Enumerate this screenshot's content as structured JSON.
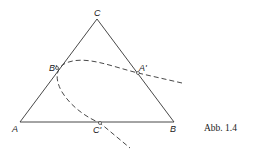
{
  "figure": {
    "caption": "Abb. 1.4",
    "vertices": {
      "A": {
        "label": "A",
        "x": 20,
        "y": 122
      },
      "B": {
        "label": "B",
        "x": 174,
        "y": 122
      },
      "C": {
        "label": "C",
        "x": 97,
        "y": 19
      }
    },
    "points": {
      "A_prime": {
        "label": "A'",
        "x": 138,
        "y": 73
      },
      "B_prime": {
        "label": "B'",
        "x": 57,
        "y": 68
      },
      "C_prime": {
        "label": "C'",
        "x": 100,
        "y": 123
      }
    },
    "colors": {
      "line": "#333333",
      "background": "#ffffff"
    }
  }
}
